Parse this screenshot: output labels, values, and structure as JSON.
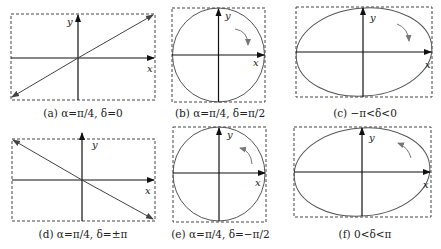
{
  "figure": {
    "panels": [
      {
        "id": "a",
        "caption": "(a) α=π/4, δ=0",
        "shape": "line",
        "slope": "positive",
        "rotation": "none"
      },
      {
        "id": "b",
        "caption": "(b) α=π/4, δ=π/2",
        "shape": "circle",
        "rotation": "clockwise"
      },
      {
        "id": "c",
        "caption": "(c) −π<δ<0",
        "shape": "ellipse",
        "rotation": "clockwise"
      },
      {
        "id": "d",
        "caption": "(d) α=π/4, δ=±π",
        "shape": "line",
        "slope": "negative",
        "rotation": "none"
      },
      {
        "id": "e",
        "caption": "(e) α=π/4, δ=−π/2",
        "shape": "circle",
        "rotation": "counterclockwise"
      },
      {
        "id": "f",
        "caption": "(f) 0<δ<π",
        "shape": "ellipse",
        "rotation": "counterclockwise"
      }
    ],
    "axis_labels": {
      "x": "x",
      "y": "y"
    },
    "colors": {
      "axis": "#111111",
      "curve": "#555555",
      "frame": "#444444",
      "rotation_arrow": "#777777"
    }
  }
}
